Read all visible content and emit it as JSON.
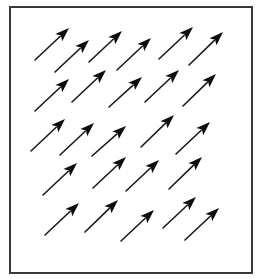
{
  "figure": {
    "frame": {
      "x": 10,
      "y": 7,
      "width": 242,
      "height": 266,
      "color": "#3a3a3a"
    },
    "arrow_color": "#0d0d0d",
    "arrow_head_length": 14,
    "arrow_head_width": 10,
    "arrows": [
      {
        "row": 1,
        "tail": [
          35,
          60
        ],
        "tip": [
          69,
          28
        ]
      },
      {
        "row": 1,
        "tail": [
          55,
          72
        ],
        "tip": [
          89,
          40
        ]
      },
      {
        "row": 1,
        "tail": [
          89,
          62
        ],
        "tip": [
          122,
          31
        ]
      },
      {
        "row": 1,
        "tail": [
          117,
          70
        ],
        "tip": [
          151,
          38
        ]
      },
      {
        "row": 1,
        "tail": [
          159,
          59
        ],
        "tip": [
          193,
          27
        ]
      },
      {
        "row": 1,
        "tail": [
          189,
          65
        ],
        "tip": [
          223,
          32
        ]
      },
      {
        "row": 2,
        "tail": [
          35,
          111
        ],
        "tip": [
          69,
          79
        ]
      },
      {
        "row": 2,
        "tail": [
          72,
          102
        ],
        "tip": [
          106,
          70
        ]
      },
      {
        "row": 2,
        "tail": [
          109,
          107
        ],
        "tip": [
          142,
          77
        ]
      },
      {
        "row": 2,
        "tail": [
          145,
          102
        ],
        "tip": [
          179,
          70
        ]
      },
      {
        "row": 2,
        "tail": [
          183,
          106
        ],
        "tip": [
          216,
          74
        ]
      },
      {
        "row": 3,
        "tail": [
          31,
          151
        ],
        "tip": [
          65,
          119
        ]
      },
      {
        "row": 3,
        "tail": [
          60,
          155
        ],
        "tip": [
          94,
          123
        ]
      },
      {
        "row": 3,
        "tail": [
          92,
          156
        ],
        "tip": [
          126,
          126
        ]
      },
      {
        "row": 3,
        "tail": [
          141,
          147
        ],
        "tip": [
          174,
          115
        ]
      },
      {
        "row": 3,
        "tail": [
          176,
          154
        ],
        "tip": [
          210,
          122
        ]
      },
      {
        "row": 4,
        "tail": [
          43,
          195
        ],
        "tip": [
          77,
          163
        ]
      },
      {
        "row": 4,
        "tail": [
          93,
          188
        ],
        "tip": [
          126,
          157
        ]
      },
      {
        "row": 4,
        "tail": [
          126,
          191
        ],
        "tip": [
          159,
          160
        ]
      },
      {
        "row": 4,
        "tail": [
          169,
          189
        ],
        "tip": [
          202,
          157
        ]
      },
      {
        "row": 5,
        "tail": [
          45,
          235
        ],
        "tip": [
          79,
          203
        ]
      },
      {
        "row": 5,
        "tail": [
          85,
          232
        ],
        "tip": [
          118,
          200
        ]
      },
      {
        "row": 5,
        "tail": [
          121,
          241
        ],
        "tip": [
          154,
          210
        ]
      },
      {
        "row": 5,
        "tail": [
          163,
          228
        ],
        "tip": [
          196,
          197
        ]
      },
      {
        "row": 5,
        "tail": [
          185,
          240
        ],
        "tip": [
          219,
          208
        ]
      }
    ]
  }
}
